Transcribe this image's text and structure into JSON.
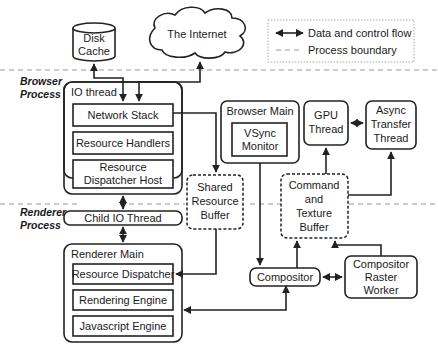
{
  "legend": {
    "flow_label": "Data and control flow",
    "boundary_label": "Process boundary"
  },
  "process_labels": {
    "browser": [
      "Browser",
      "Process"
    ],
    "renderer": [
      "Renderer",
      "Process"
    ]
  },
  "nodes": {
    "disk_cache": [
      "Disk",
      "Cache"
    ],
    "internet": "The Internet",
    "io_thread": {
      "title": "IO thread",
      "network_stack": "Network Stack",
      "resource_handlers": "Resource Handlers",
      "dispatcher_host": [
        "Resource",
        "Dispatcher Host"
      ]
    },
    "browser_main": {
      "title": "Browser Main",
      "vsync": [
        "VSync",
        "Monitor"
      ]
    },
    "gpu_thread": [
      "GPU",
      "Thread"
    ],
    "async_transfer": [
      "Async",
      "Transfer",
      "Thread"
    ],
    "shared_buffer": [
      "Shared",
      "Resource",
      "Buffer"
    ],
    "command_buffer": [
      "Command",
      "and",
      "Texture",
      "Buffer"
    ],
    "child_io": "Child IO Thread",
    "renderer_main": {
      "title": "Renderer Main",
      "resource_dispatcher": "Resource Dispatcher",
      "rendering_engine": "Rendering Engine",
      "js_engine": "Javascript Engine"
    },
    "compositor": "Compositor",
    "raster_worker": [
      "Compositor",
      "Raster",
      "Worker"
    ]
  }
}
